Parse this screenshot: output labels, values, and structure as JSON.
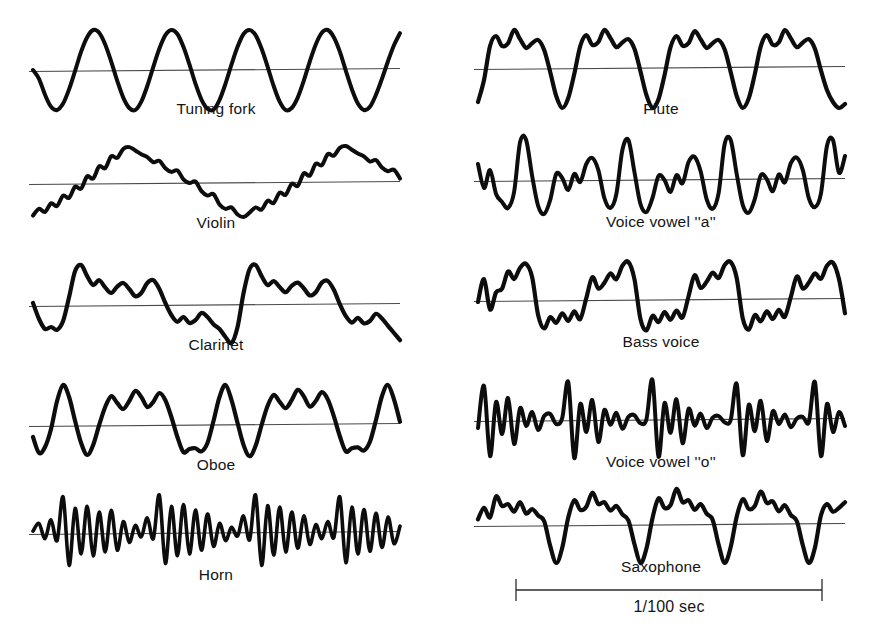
{
  "figure": {
    "background": "#ffffff",
    "trace_color": "#0d0d0d",
    "axis_color": "#4a4a4a",
    "text_color": "#141414"
  },
  "scale_bar": {
    "label": "1/100 sec",
    "x_start": 516,
    "x_end": 822,
    "y": 590,
    "tick_height": 22,
    "label_x": 669,
    "label_y": 598
  },
  "chart_data": {
    "type": "line",
    "title": "",
    "subtitle": "",
    "xlabel": "",
    "ylabel": "",
    "grid": false,
    "legend": "none",
    "annotations": [
      "1/100 sec"
    ],
    "panels": [
      {
        "label": "Tuning fork",
        "column": "left",
        "row": 1,
        "cycles": 4,
        "character": "pure sinusoid, single frequency, no harmonics",
        "geometry": {
          "x0": 33,
          "x1": 400,
          "baseline": 70,
          "amplitude": 40,
          "stroke": 4.0,
          "label_x": 216,
          "label_y": 100
        },
        "samples": [
          0.0,
          -0.22,
          -0.62,
          -0.92,
          -1.0,
          -0.84,
          -0.48,
          -0.02,
          0.46,
          0.82,
          1.0,
          0.93,
          0.64,
          0.21,
          -0.27,
          -0.69,
          -0.95,
          -1.0,
          -0.79,
          -0.4,
          0.08,
          0.53,
          0.87,
          1.0,
          0.9,
          0.58,
          0.14,
          -0.34,
          -0.74,
          -0.97,
          -0.99,
          -0.75,
          -0.34,
          0.14,
          0.58,
          0.9,
          1.0,
          0.87,
          0.53,
          0.08,
          -0.4,
          -0.79,
          -1.0,
          -0.95,
          -0.69,
          -0.27,
          0.21,
          0.64,
          0.93,
          1.0,
          0.82,
          0.46,
          -0.02,
          -0.48,
          -0.84,
          -1.0,
          -0.92,
          -0.62,
          -0.22,
          0.22,
          0.62,
          0.92
        ]
      },
      {
        "label": "Violin",
        "column": "left",
        "row": 2,
        "cycles": 4,
        "character": "sawtooth-like with fine high-harmonic ripple on the slopes",
        "geometry": {
          "x0": 33,
          "x1": 400,
          "baseline": 183,
          "amplitude": 37,
          "stroke": 4.0,
          "label_x": 216,
          "label_y": 214
        },
        "samples": [
          -0.88,
          -0.7,
          -0.78,
          -0.55,
          -0.62,
          -0.34,
          -0.4,
          -0.1,
          -0.15,
          0.18,
          0.12,
          0.45,
          0.4,
          0.72,
          0.68,
          0.92,
          0.97,
          0.88,
          0.78,
          0.7,
          0.56,
          0.6,
          0.4,
          0.3,
          0.34,
          0.1,
          0.0,
          0.04,
          -0.22,
          -0.34,
          -0.3,
          -0.58,
          -0.7,
          -0.66,
          -0.85,
          -0.92,
          -0.8,
          -0.66,
          -0.72,
          -0.48,
          -0.54,
          -0.26,
          -0.32,
          -0.02,
          -0.08,
          0.26,
          0.2,
          0.52,
          0.48,
          0.78,
          0.74,
          0.95,
          1.0,
          0.9,
          0.8,
          0.72,
          0.58,
          0.62,
          0.42,
          0.32,
          0.36,
          0.12
        ]
      },
      {
        "label": "Clarinet",
        "column": "left",
        "row": 3,
        "cycles": 4,
        "character": "square-wave character dominated by odd harmonics; sharp rise, plateau with ripples, deep narrow trough",
        "geometry": {
          "x0": 33,
          "x1": 400,
          "baseline": 305,
          "amplitude": 40,
          "stroke": 4.2,
          "label_x": 216,
          "label_y": 336
        },
        "samples": [
          0.05,
          -0.35,
          -0.6,
          -0.55,
          -0.62,
          -0.4,
          0.2,
          0.85,
          1.0,
          0.72,
          0.5,
          0.62,
          0.44,
          0.3,
          0.46,
          0.55,
          0.4,
          0.22,
          0.3,
          0.55,
          0.62,
          0.4,
          0.05,
          -0.25,
          -0.42,
          -0.3,
          -0.45,
          -0.38,
          -0.2,
          -0.3,
          -0.48,
          -0.6,
          -0.8,
          -0.95,
          -0.55,
          0.3,
          0.9,
          1.0,
          0.72,
          0.5,
          0.6,
          0.45,
          0.32,
          0.48,
          0.56,
          0.42,
          0.24,
          0.32,
          0.56,
          0.6,
          0.38,
          0.02,
          -0.28,
          -0.44,
          -0.32,
          -0.46,
          -0.4,
          -0.22,
          -0.34,
          -0.52,
          -0.7,
          -0.88
        ]
      },
      {
        "label": "Oboe",
        "column": "left",
        "row": 4,
        "cycles": 4,
        "character": "bright reedy tone; tall narrow primary peak followed by a cluster of secondary humps",
        "geometry": {
          "x0": 33,
          "x1": 400,
          "baseline": 425,
          "amplitude": 40,
          "stroke": 4.2,
          "label_x": 216,
          "label_y": 456
        },
        "samples": [
          -0.3,
          -0.7,
          -0.55,
          -0.1,
          0.6,
          1.0,
          0.7,
          0.1,
          -0.45,
          -0.75,
          -0.5,
          0.0,
          0.45,
          0.72,
          0.55,
          0.4,
          0.6,
          0.85,
          0.7,
          0.45,
          0.58,
          0.8,
          0.62,
          0.2,
          -0.3,
          -0.68,
          -0.6,
          -0.58,
          -0.66,
          -0.45,
          0.1,
          0.7,
          1.0,
          0.62,
          0.05,
          -0.5,
          -0.78,
          -0.52,
          0.0,
          0.48,
          0.75,
          0.58,
          0.42,
          0.62,
          0.88,
          0.72,
          0.46,
          0.6,
          0.82,
          0.64,
          0.22,
          -0.28,
          -0.66,
          -0.58,
          -0.56,
          -0.64,
          -0.42,
          0.12,
          0.72,
          1.0,
          0.64,
          0.08
        ]
      },
      {
        "label": "Horn",
        "column": "left",
        "row": 5,
        "cycles": 16,
        "character": "dense rapid oscillation with slow amplitude modulation; many high harmonics",
        "geometry": {
          "x0": 33,
          "x1": 400,
          "baseline": 533,
          "amplitude": 38,
          "stroke": 3.6,
          "label_x": 216,
          "label_y": 566
        },
        "samples": [
          0.05,
          0.25,
          -0.15,
          0.35,
          -0.2,
          0.95,
          -0.85,
          0.65,
          -0.55,
          0.7,
          -0.6,
          0.55,
          -0.5,
          0.6,
          -0.45,
          0.3,
          -0.25,
          0.2,
          -0.1,
          0.4,
          -0.15,
          1.0,
          -0.8,
          0.7,
          -0.6,
          0.75,
          -0.55,
          0.6,
          -0.45,
          0.5,
          -0.35,
          0.25,
          -0.2,
          0.15,
          -0.08,
          0.45,
          -0.18,
          1.0,
          -0.85,
          0.72,
          -0.58,
          0.68,
          -0.5,
          0.55,
          -0.4,
          0.45,
          -0.3,
          0.22,
          -0.15,
          0.3,
          -0.12,
          0.95,
          -0.78,
          0.68,
          -0.55,
          0.62,
          -0.48,
          0.52,
          -0.38,
          0.42,
          -0.28,
          0.18
        ]
      },
      {
        "label": "Flute",
        "column": "right",
        "row": 1,
        "cycles": 4,
        "character": "nearly pure with a weak second harmonic; rounded triple hump per cycle and a deep narrow valley",
        "geometry": {
          "x0": 478,
          "x1": 845,
          "baseline": 68,
          "amplitude": 40,
          "stroke": 4.2,
          "label_x": 661,
          "label_y": 100
        },
        "samples": [
          -0.85,
          -0.3,
          0.55,
          0.8,
          0.55,
          0.62,
          0.95,
          0.72,
          0.5,
          0.62,
          0.7,
          0.45,
          -0.1,
          -0.7,
          -1.0,
          -0.75,
          -0.15,
          0.55,
          0.82,
          0.58,
          0.65,
          0.95,
          0.75,
          0.52,
          0.64,
          0.72,
          0.48,
          -0.08,
          -0.68,
          -1.0,
          -0.78,
          -0.18,
          0.52,
          0.8,
          0.56,
          0.62,
          0.92,
          0.72,
          0.5,
          0.62,
          0.7,
          0.46,
          -0.1,
          -0.7,
          -1.0,
          -0.76,
          -0.16,
          0.54,
          0.82,
          0.58,
          0.64,
          0.95,
          0.74,
          0.52,
          0.64,
          0.72,
          0.48,
          -0.06,
          -0.55,
          -0.85,
          -1.0,
          -0.9
        ]
      },
      {
        "label": "Voice vowel ''a''",
        "column": "right",
        "row": 2,
        "cycles": 5,
        "character": "vocal fold pulses with strong formant ringing; tall sharp spikes separated by decaying wiggles",
        "geometry": {
          "x0": 478,
          "x1": 845,
          "baseline": 180,
          "amplitude": 40,
          "stroke": 4.0,
          "label_x": 661,
          "label_y": 213
        },
        "samples": [
          0.4,
          -0.2,
          0.25,
          -0.35,
          -0.55,
          -0.7,
          -0.3,
          0.95,
          1.0,
          0.1,
          -0.65,
          -0.85,
          -0.5,
          0.15,
          0.05,
          -0.25,
          0.15,
          -0.05,
          0.4,
          0.55,
          0.25,
          -0.45,
          -0.7,
          -0.35,
          0.75,
          1.0,
          0.2,
          -0.6,
          -0.8,
          -0.45,
          0.1,
          0.0,
          -0.3,
          0.12,
          -0.08,
          0.45,
          0.58,
          0.22,
          -0.48,
          -0.72,
          -0.32,
          0.9,
          1.0,
          0.15,
          -0.62,
          -0.82,
          -0.48,
          0.12,
          0.02,
          -0.28,
          0.14,
          -0.06,
          0.42,
          0.56,
          0.24,
          -0.46,
          -0.68,
          -0.34,
          0.85,
          1.0,
          0.18,
          0.6
        ]
      },
      {
        "label": "Bass voice",
        "column": "right",
        "row": 3,
        "cycles": 4,
        "character": "rich low-pitched voice; stepped rising cluster then abrupt fall into rippling trough",
        "geometry": {
          "x0": 478,
          "x1": 845,
          "baseline": 300,
          "amplitude": 38,
          "stroke": 4.2,
          "label_x": 661,
          "label_y": 333
        },
        "samples": [
          -0.05,
          0.55,
          -0.25,
          0.2,
          0.3,
          0.75,
          0.55,
          0.85,
          0.95,
          0.6,
          -0.4,
          -0.75,
          -0.45,
          -0.6,
          -0.35,
          -0.55,
          -0.3,
          -0.5,
          0.05,
          0.6,
          0.3,
          0.45,
          0.7,
          0.55,
          0.9,
          1.0,
          0.55,
          -0.5,
          -0.8,
          -0.42,
          -0.58,
          -0.32,
          -0.52,
          -0.28,
          -0.46,
          0.1,
          0.65,
          0.32,
          0.48,
          0.72,
          0.58,
          0.92,
          1.0,
          0.58,
          -0.48,
          -0.78,
          -0.4,
          -0.56,
          -0.3,
          -0.5,
          -0.26,
          -0.44,
          0.08,
          0.62,
          0.3,
          0.46,
          0.7,
          0.56,
          0.9,
          0.98,
          0.55,
          -0.35
        ]
      },
      {
        "label": "Voice vowel ''o''",
        "column": "right",
        "row": 4,
        "cycles": 5,
        "character": "rounded vowel; narrow bipolar spikes with low-level ripple between pulses",
        "geometry": {
          "x0": 478,
          "x1": 845,
          "baseline": 420,
          "amplitude": 40,
          "stroke": 4.0,
          "label_x": 661,
          "label_y": 453
        },
        "samples": [
          -0.2,
          0.85,
          -0.9,
          0.45,
          -0.35,
          0.55,
          -0.6,
          0.3,
          -0.15,
          0.2,
          -0.25,
          0.1,
          0.15,
          -0.1,
          0.05,
          0.95,
          -0.95,
          0.4,
          -0.3,
          0.5,
          -0.55,
          0.25,
          -0.12,
          0.18,
          -0.22,
          0.08,
          0.12,
          -0.08,
          0.02,
          1.0,
          -0.92,
          0.42,
          -0.32,
          0.52,
          -0.58,
          0.28,
          -0.14,
          0.16,
          -0.2,
          0.06,
          0.1,
          -0.06,
          0.0,
          0.9,
          -0.88,
          0.38,
          -0.28,
          0.48,
          -0.52,
          0.22,
          -0.1,
          0.14,
          -0.18,
          0.04,
          0.08,
          -0.05,
          0.95,
          -0.9,
          0.4,
          -0.3,
          0.2,
          -0.15
        ]
      },
      {
        "label": "Saxophone",
        "column": "right",
        "row": 5,
        "cycles": 4,
        "character": "reedy timbre; cluster of rounded humps above the axis with a deep narrow spike downward each cycle",
        "geometry": {
          "x0": 478,
          "x1": 845,
          "baseline": 525,
          "amplitude": 38,
          "stroke": 4.2,
          "label_x": 661,
          "label_y": 558
        },
        "samples": [
          0.15,
          0.45,
          0.2,
          0.75,
          0.5,
          0.55,
          0.35,
          0.6,
          0.3,
          0.42,
          0.25,
          0.1,
          -0.55,
          -1.0,
          -0.6,
          0.2,
          0.65,
          0.4,
          0.48,
          0.85,
          0.55,
          0.6,
          0.38,
          0.5,
          0.28,
          0.12,
          -0.5,
          -1.0,
          -0.62,
          0.18,
          0.7,
          0.45,
          0.52,
          0.95,
          0.6,
          0.65,
          0.4,
          0.55,
          0.3,
          0.14,
          -0.52,
          -1.0,
          -0.58,
          0.22,
          0.68,
          0.42,
          0.5,
          0.88,
          0.58,
          0.62,
          0.36,
          0.52,
          0.26,
          0.1,
          -0.54,
          -1.0,
          -0.6,
          0.25,
          0.55,
          0.35,
          0.45,
          0.6
        ]
      }
    ]
  }
}
